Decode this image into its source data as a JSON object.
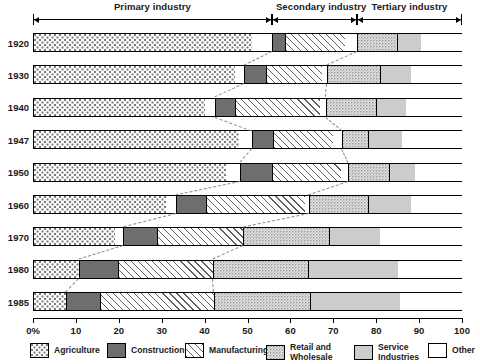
{
  "chart_data": {
    "type": "bar",
    "orientation": "horizontal",
    "stacked": true,
    "title": "",
    "xlabel": "",
    "ylabel": "",
    "xlim": [
      0,
      100
    ],
    "grid": false,
    "legend_position": "bottom",
    "tick_labels": [
      "0%",
      "10",
      "20",
      "30",
      "40",
      "50",
      "60",
      "70",
      "80",
      "90",
      "100"
    ],
    "tick_values": [
      0,
      10,
      20,
      30,
      40,
      50,
      60,
      70,
      80,
      90,
      100
    ],
    "categories": [
      "1920",
      "1930",
      "1940",
      "1947",
      "1950",
      "1960",
      "1970",
      "1980",
      "1985"
    ],
    "series": [
      {
        "name": "Agriculture",
        "values": [
          51.0,
          47.0,
          40.0,
          48.0,
          45.0,
          31.0,
          19.0,
          10.8,
          7.7
        ]
      },
      {
        "name": "Construction",
        "values": [
          3.0,
          5.0,
          4.5,
          5.0,
          7.5,
          7.0,
          8.0,
          8.5,
          7.9
        ]
      },
      {
        "name": "Manufacturing",
        "values": [
          14.0,
          13.0,
          20.0,
          14.0,
          16.0,
          23.0,
          20.0,
          22.0,
          26.6
        ]
      },
      {
        "name": "Retail and Wholesale",
        "values": [
          12.0,
          14.0,
          13.0,
          8.0,
          11.0,
          15.0,
          20.0,
          22.0,
          22.4
        ]
      },
      {
        "name": "Service Industries",
        "values": [
          5.6,
          7.0,
          7.0,
          8.0,
          6.0,
          10.0,
          12.0,
          21.0,
          20.9
        ]
      },
      {
        "name": "Other",
        "values": [
          9.6,
          10.0,
          12.5,
          14.0,
          11.5,
          12.0,
          19.0,
          15.0,
          14.5
        ]
      }
    ],
    "bars": [
      {
        "year": "1920",
        "segments": [
          {
            "series": "Agriculture",
            "start": 0.0,
            "end": 51.0
          },
          {
            "series": "Other",
            "start": 51.0,
            "end": 55.7
          },
          {
            "series": "Construction",
            "start": 55.7,
            "end": 58.7
          },
          {
            "series": "Manufacturing",
            "start": 58.7,
            "end": 72.7
          },
          {
            "series": "Other",
            "start": 72.7,
            "end": 75.5
          },
          {
            "series": "Retail and Wholesale",
            "start": 75.5,
            "end": 84.8
          },
          {
            "series": "Service Industries",
            "start": 84.8,
            "end": 90.4
          },
          {
            "series": "Other",
            "start": 90.4,
            "end": 100.0
          }
        ]
      },
      {
        "year": "1930",
        "segments": [
          {
            "series": "Agriculture",
            "start": 0.0,
            "end": 47.0
          },
          {
            "series": "Other",
            "start": 47.0,
            "end": 49.3
          },
          {
            "series": "Construction",
            "start": 49.3,
            "end": 54.3
          },
          {
            "series": "Manufacturing",
            "start": 54.3,
            "end": 67.3
          },
          {
            "series": "Other",
            "start": 67.3,
            "end": 68.5
          },
          {
            "series": "Retail and Wholesale",
            "start": 68.5,
            "end": 81.0
          },
          {
            "series": "Service Industries",
            "start": 81.0,
            "end": 88.0
          },
          {
            "series": "Other",
            "start": 88.0,
            "end": 100.0
          }
        ]
      },
      {
        "year": "1940",
        "segments": [
          {
            "series": "Agriculture",
            "start": 0.0,
            "end": 40.0
          },
          {
            "series": "Other",
            "start": 40.0,
            "end": 42.5
          },
          {
            "series": "Construction",
            "start": 42.5,
            "end": 47.0
          },
          {
            "series": "Manufacturing",
            "start": 47.0,
            "end": 67.0
          },
          {
            "series": "Other",
            "start": 67.0,
            "end": 68.2
          },
          {
            "series": "Retail and Wholesale",
            "start": 68.2,
            "end": 80.0
          },
          {
            "series": "Service Industries",
            "start": 80.0,
            "end": 87.0
          },
          {
            "series": "Other",
            "start": 87.0,
            "end": 100.0
          }
        ]
      },
      {
        "year": "1947",
        "segments": [
          {
            "series": "Agriculture",
            "start": 0.0,
            "end": 48.0
          },
          {
            "series": "Other",
            "start": 48.0,
            "end": 51.0
          },
          {
            "series": "Construction",
            "start": 51.0,
            "end": 56.0
          },
          {
            "series": "Manufacturing",
            "start": 56.0,
            "end": 70.0
          },
          {
            "series": "Other",
            "start": 70.0,
            "end": 72.0
          },
          {
            "series": "Retail and Wholesale",
            "start": 72.0,
            "end": 78.0
          },
          {
            "series": "Service Industries",
            "start": 78.0,
            "end": 86.0
          },
          {
            "series": "Other",
            "start": 86.0,
            "end": 100.0
          }
        ]
      },
      {
        "year": "1950",
        "segments": [
          {
            "series": "Agriculture",
            "start": 0.0,
            "end": 45.0
          },
          {
            "series": "Other",
            "start": 45.0,
            "end": 48.3
          },
          {
            "series": "Construction",
            "start": 48.3,
            "end": 55.8
          },
          {
            "series": "Manufacturing",
            "start": 55.8,
            "end": 71.8
          },
          {
            "series": "Other",
            "start": 71.8,
            "end": 73.5
          },
          {
            "series": "Retail and Wholesale",
            "start": 73.5,
            "end": 83.0
          },
          {
            "series": "Service Industries",
            "start": 83.0,
            "end": 89.0
          },
          {
            "series": "Other",
            "start": 89.0,
            "end": 100.0
          }
        ]
      },
      {
        "year": "1960",
        "segments": [
          {
            "series": "Agriculture",
            "start": 0.0,
            "end": 31.0
          },
          {
            "series": "Other",
            "start": 31.0,
            "end": 33.3
          },
          {
            "series": "Construction",
            "start": 33.3,
            "end": 40.3
          },
          {
            "series": "Manufacturing",
            "start": 40.3,
            "end": 63.3
          },
          {
            "series": "Other",
            "start": 63.3,
            "end": 64.3
          },
          {
            "series": "Retail and Wholesale",
            "start": 64.3,
            "end": 78.0
          },
          {
            "series": "Service Industries",
            "start": 78.0,
            "end": 88.0
          },
          {
            "series": "Other",
            "start": 88.0,
            "end": 100.0
          }
        ]
      },
      {
        "year": "1970",
        "segments": [
          {
            "series": "Agriculture",
            "start": 0.0,
            "end": 19.0
          },
          {
            "series": "Other",
            "start": 19.0,
            "end": 21.0
          },
          {
            "series": "Construction",
            "start": 21.0,
            "end": 29.0
          },
          {
            "series": "Manufacturing",
            "start": 29.0,
            "end": 49.0
          },
          {
            "series": "Retail and Wholesale",
            "start": 49.0,
            "end": 69.0
          },
          {
            "series": "Service Industries",
            "start": 69.0,
            "end": 81.0
          },
          {
            "series": "Other",
            "start": 81.0,
            "end": 100.0
          }
        ]
      },
      {
        "year": "1980",
        "segments": [
          {
            "series": "Agriculture",
            "start": 0.0,
            "end": 10.8
          },
          {
            "series": "Construction",
            "start": 10.8,
            "end": 19.8
          },
          {
            "series": "Manufacturing",
            "start": 19.8,
            "end": 42.0
          },
          {
            "series": "Retail and Wholesale",
            "start": 42.0,
            "end": 64.0
          },
          {
            "series": "Service Industries",
            "start": 64.0,
            "end": 85.0
          },
          {
            "series": "Other",
            "start": 85.0,
            "end": 100.0
          }
        ]
      },
      {
        "year": "1985",
        "segments": [
          {
            "series": "Agriculture",
            "start": 0.0,
            "end": 7.7
          },
          {
            "series": "Construction",
            "start": 7.7,
            "end": 15.6
          },
          {
            "series": "Manufacturing",
            "start": 15.6,
            "end": 42.2
          },
          {
            "series": "Retail and Wholesale",
            "start": 42.2,
            "end": 64.6
          },
          {
            "series": "Service Industries",
            "start": 64.6,
            "end": 85.5
          },
          {
            "series": "Other",
            "start": 85.5,
            "end": 100.0
          }
        ]
      }
    ],
    "brackets": [
      {
        "label": "Primary industry",
        "start": 0.0,
        "end": 55.7
      },
      {
        "label": "Secondary industry",
        "start": 55.7,
        "end": 75.5
      },
      {
        "label": "Tertiary industry",
        "start": 75.5,
        "end": 100.0
      }
    ],
    "legend": [
      {
        "label": "Agriculture",
        "fill": "f-agri",
        "color": "#fdfdfd"
      },
      {
        "label": "Construction",
        "fill": "f-constr",
        "color": "#6e6e6e"
      },
      {
        "label": "Manufacturing",
        "fill": "f-manu",
        "color": "#fefefe"
      },
      {
        "label": "Retail and\nWholesale",
        "fill": "f-retail",
        "color": "#f2f2f2"
      },
      {
        "label": "Service\nIndustries",
        "fill": "f-serv",
        "color": "#cccccc"
      },
      {
        "label": "Other",
        "fill": "f-other",
        "color": "#ffffff"
      }
    ],
    "connectors": [
      {
        "from_bar": 0,
        "to_bar": 1,
        "from_pct": 55.7,
        "to_pct": 49.3
      },
      {
        "from_bar": 0,
        "to_bar": 1,
        "from_pct": 75.5,
        "to_pct": 68.5
      },
      {
        "from_bar": 1,
        "to_bar": 2,
        "from_pct": 49.3,
        "to_pct": 42.5
      },
      {
        "from_bar": 1,
        "to_bar": 2,
        "from_pct": 68.5,
        "to_pct": 68.2
      },
      {
        "from_bar": 2,
        "to_bar": 3,
        "from_pct": 42.5,
        "to_pct": 51.0
      },
      {
        "from_bar": 2,
        "to_bar": 3,
        "from_pct": 68.2,
        "to_pct": 72.0
      },
      {
        "from_bar": 3,
        "to_bar": 4,
        "from_pct": 51.0,
        "to_pct": 48.3
      },
      {
        "from_bar": 3,
        "to_bar": 4,
        "from_pct": 72.0,
        "to_pct": 73.5
      },
      {
        "from_bar": 4,
        "to_bar": 5,
        "from_pct": 48.3,
        "to_pct": 33.3
      },
      {
        "from_bar": 4,
        "to_bar": 5,
        "from_pct": 73.5,
        "to_pct": 64.3
      },
      {
        "from_bar": 5,
        "to_bar": 6,
        "from_pct": 33.3,
        "to_pct": 21.0
      },
      {
        "from_bar": 5,
        "to_bar": 6,
        "from_pct": 64.3,
        "to_pct": 49.0
      },
      {
        "from_bar": 6,
        "to_bar": 7,
        "from_pct": 21.0,
        "to_pct": 10.8
      },
      {
        "from_bar": 6,
        "to_bar": 7,
        "from_pct": 49.0,
        "to_pct": 42.0
      },
      {
        "from_bar": 7,
        "to_bar": 8,
        "from_pct": 10.8,
        "to_pct": 7.7
      },
      {
        "from_bar": 7,
        "to_bar": 8,
        "from_pct": 42.0,
        "to_pct": 42.2
      }
    ]
  }
}
